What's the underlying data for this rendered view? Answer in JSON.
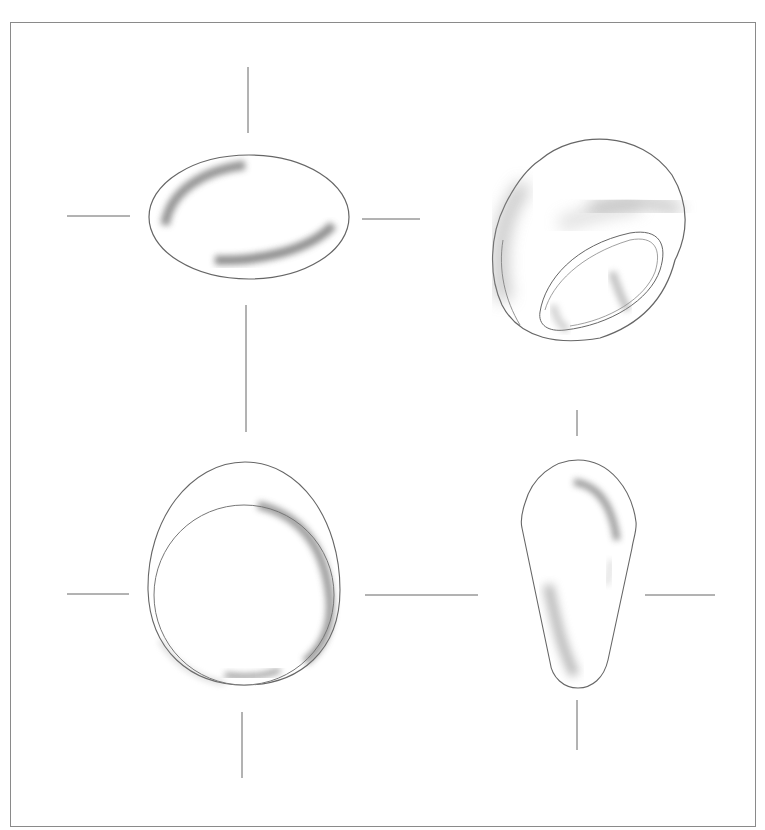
{
  "figure": {
    "frame_color": "#8a8a8a",
    "line_color": "#555555",
    "shade_color": "#8c8c8c",
    "views": [
      {
        "id": "top",
        "label": "Top view",
        "shape": "ellipse",
        "center": [
          249,
          217
        ],
        "rx": 100,
        "ry": 62
      },
      {
        "id": "perspective",
        "label": "Perspective view",
        "shape": "dome ring",
        "bbox": [
          493,
          133,
          683,
          342
        ]
      },
      {
        "id": "front",
        "label": "Front view",
        "shape": "oval with inner circle",
        "center": [
          243,
          595
        ],
        "outer_bbox": [
          148,
          462,
          340,
          685
        ],
        "inner_r": 91
      },
      {
        "id": "side",
        "label": "Side view",
        "shape": "teardrop",
        "bbox": [
          521,
          460,
          636,
          688
        ]
      }
    ]
  }
}
